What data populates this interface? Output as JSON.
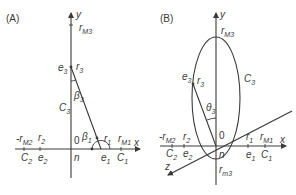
{
  "panels": [
    {
      "id": "A",
      "label": "(A)",
      "axes": {
        "y": "y",
        "x": "x",
        "origin": "0",
        "origin_below": "n"
      },
      "points": {
        "rM3": {
          "main": "r",
          "sub": "M3"
        },
        "e3": {
          "main": "e",
          "sub": "3"
        },
        "r3": {
          "main": "r",
          "sub": "3"
        },
        "beta3": {
          "main": "β",
          "sub": "3"
        },
        "C3": {
          "main": "C",
          "sub": "3"
        },
        "minus_rM2": {
          "main": "-r",
          "sub": "M2"
        },
        "r2": {
          "main": "r",
          "sub": "2"
        },
        "C2": {
          "main": "C",
          "sub": "2"
        },
        "e2": {
          "main": "e",
          "sub": "2"
        },
        "beta1": {
          "main": "β",
          "sub": "1"
        },
        "r1": {
          "main": "r",
          "sub": "1"
        },
        "rM1": {
          "main": "r",
          "sub": "M1"
        },
        "e1": {
          "main": "e",
          "sub": "1"
        },
        "C1": {
          "main": "C",
          "sub": "1"
        }
      }
    },
    {
      "id": "B",
      "label": "(B)",
      "axes": {
        "y": "y",
        "x": "x",
        "z": "z",
        "origin": "0",
        "origin_below": "n"
      },
      "points": {
        "rM3": {
          "main": "r",
          "sub": "M3"
        },
        "e3": {
          "main": "e",
          "sub": "3"
        },
        "r3": {
          "main": "r",
          "sub": "3"
        },
        "theta3": {
          "main": "θ",
          "sub": "3"
        },
        "C3": {
          "main": "C",
          "sub": "3"
        },
        "minus_rM2": {
          "main": "-r",
          "sub": "M2"
        },
        "r2": {
          "main": "r",
          "sub": "2"
        },
        "C2": {
          "main": "C",
          "sub": "2"
        },
        "e2": {
          "main": "e",
          "sub": "2"
        },
        "r1": {
          "main": "r",
          "sub": "1"
        },
        "rM1": {
          "main": "r",
          "sub": "M1"
        },
        "e1": {
          "main": "e",
          "sub": "1"
        },
        "C1": {
          "main": "C",
          "sub": "1"
        },
        "rm3": {
          "main": "r",
          "sub": "m3"
        }
      }
    }
  ]
}
